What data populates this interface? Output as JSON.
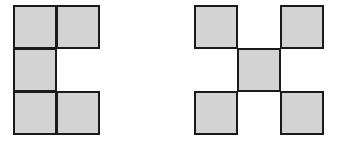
{
  "figure": {
    "square_size": 43,
    "fill_color": "#d3d3d3",
    "border_color": "#1a1a1a",
    "shapes": [
      {
        "name": "c-shape",
        "cells": [
          {
            "x": 13,
            "y": 5
          },
          {
            "x": 56,
            "y": 5
          },
          {
            "x": 13,
            "y": 48
          },
          {
            "x": 13,
            "y": 91
          },
          {
            "x": 56,
            "y": 91
          }
        ]
      },
      {
        "name": "x-shape",
        "cells": [
          {
            "x": 194,
            "y": 5
          },
          {
            "x": 280,
            "y": 5
          },
          {
            "x": 237,
            "y": 48
          },
          {
            "x": 194,
            "y": 91
          },
          {
            "x": 280,
            "y": 91
          }
        ]
      }
    ]
  }
}
